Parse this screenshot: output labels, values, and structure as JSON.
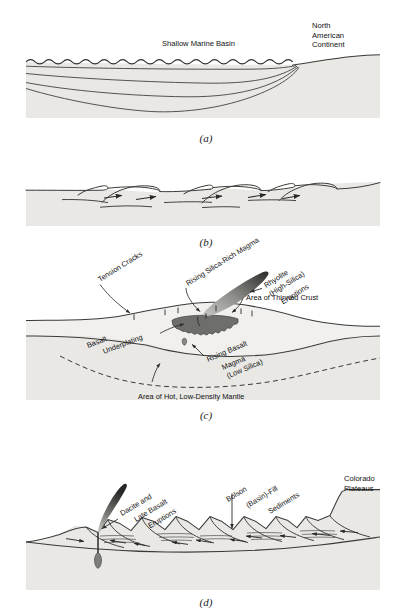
{
  "figure": {
    "type": "geologic-cross-section-sequence",
    "panels": [
      {
        "id": "a",
        "caption": "(a)",
        "labels": [
          {
            "name": "shallow-marine-basin",
            "text": "Shallow Marine Basin"
          },
          {
            "name": "north-american-continent",
            "lines": [
              "North",
              "American",
              "Continent"
            ]
          }
        ]
      },
      {
        "id": "b",
        "caption": "(b)",
        "labels": []
      },
      {
        "id": "c",
        "caption": "(c)",
        "labels": [
          {
            "name": "tension-cracks",
            "text": "Tension Cracks"
          },
          {
            "name": "rising-silica-rich-magma",
            "text": "Rising Silica-Rich Magma"
          },
          {
            "name": "rhyolite-eruptions",
            "lines": [
              "Rhyolite",
              "(High-Silica)",
              "Eruptions"
            ]
          },
          {
            "name": "area-of-thinned-crust",
            "text": "Area of Thinned Crust"
          },
          {
            "name": "basalt-underplating",
            "lines": [
              "Basalt",
              "Underplating"
            ]
          },
          {
            "name": "rising-basalt-magma",
            "lines": [
              "Rising Basalt",
              "Magma",
              "(Low Silica)"
            ]
          },
          {
            "name": "area-of-hot-low-density-mantle",
            "text": "Area of Hot, Low-Density Mantle"
          }
        ]
      },
      {
        "id": "d",
        "caption": "(d)",
        "labels": [
          {
            "name": "dacite-late-basalt-eruptions",
            "lines": [
              "Dacite and",
              "Late Basalt",
              "Eruptions"
            ]
          },
          {
            "name": "bolson-basin-fill-sediments",
            "lines": [
              "Bolson",
              "(Basin)-Fill",
              "Sediments"
            ]
          },
          {
            "name": "colorado-plateaus",
            "lines": [
              "Colorado",
              "Plateaus"
            ]
          }
        ]
      }
    ],
    "colors": {
      "page_background": "#ffffff",
      "rock_fill": "#e9e8e5",
      "rock_fill_light": "#f1f0ee",
      "stroke": "#3a3a38",
      "magma_dark": "#2e2e2c",
      "magma_mid": "#6e6e6b",
      "magma_light": "#b9b9b6",
      "text": "#111111"
    }
  }
}
